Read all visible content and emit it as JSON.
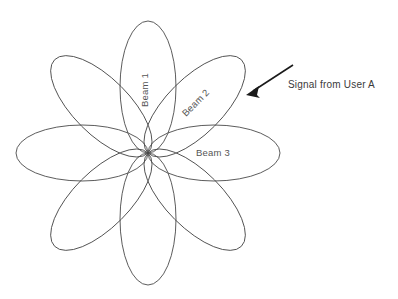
{
  "figure": {
    "background_color": "#ffffff",
    "stroke_color": "#4a4a4a",
    "arrow_color": "#1a1a1a",
    "text_color": "#555555",
    "annotation_text_color": "#3a3a3a"
  },
  "diagram": {
    "type": "antenna-beam-pattern",
    "center": {
      "x": 148,
      "y": 153
    },
    "petal_count": 8,
    "petal_length": 132,
    "petal_width": 56,
    "petal_angles_deg": [
      0,
      45,
      90,
      135,
      180,
      225,
      270,
      315
    ]
  },
  "labels": {
    "beam1": "Beam 1",
    "beam2": "Beam 2",
    "beam3": "Beam 3",
    "signal": "Signal from User A"
  },
  "label_placement": {
    "beam1": {
      "x": 148,
      "y": 90,
      "rotation_deg": -90
    },
    "beam2": {
      "x": 198,
      "y": 105,
      "rotation_deg": -45
    },
    "beam3": {
      "x": 196,
      "y": 156,
      "rotation_deg": 0
    },
    "signal": {
      "x": 288,
      "y": 88,
      "rotation_deg": 0
    }
  },
  "arrow": {
    "tail": {
      "x": 293,
      "y": 65
    },
    "tip": {
      "x": 246,
      "y": 95
    }
  }
}
